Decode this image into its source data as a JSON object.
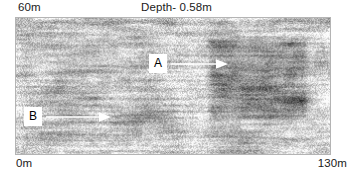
{
  "figure": {
    "type": "gpr-depth-slice",
    "top_left_label": "60m",
    "depth_label": "Depth- 0.58m",
    "bottom_left_label": "0m",
    "bottom_right_label": "130m"
  },
  "annotations": [
    {
      "id": "A",
      "label": "A",
      "arrow_direction": "right",
      "arrow_color": "#ffffff",
      "box_background": "#ffffff",
      "box_text_color": "#000000"
    },
    {
      "id": "B",
      "label": "B",
      "arrow_direction": "right",
      "arrow_color": "#ffffff",
      "box_background": "#ffffff",
      "box_text_color": "#000000"
    }
  ],
  "chart_data": {
    "type": "heatmap",
    "title": "Depth- 0.58m",
    "xlabel": "",
    "ylabel": "",
    "x_axis": {
      "start_label": "0m",
      "end_label": "130m",
      "start_value": 0,
      "end_value": 130,
      "units": "m"
    },
    "y_axis": {
      "top_label": "60m",
      "bottom_label": "0m",
      "top_value": 60,
      "bottom_value": 0,
      "units": "m"
    },
    "depth": 0.58,
    "depth_units": "m",
    "colormap": "grayscale",
    "grid": false,
    "legend": "none",
    "background_color": "#c8c8c8",
    "features": [
      {
        "name": "dark-anomaly-block",
        "marker": "A",
        "description": "large dark high-amplitude rectangular anomaly right of centre",
        "x_range_m": [
          78,
          122
        ],
        "y_range_m": [
          14,
          52
        ],
        "relative_intensity": 0.72
      },
      {
        "name": "horizontal-banding",
        "marker": "B",
        "description": "strong horizontal layered banding across lower left half",
        "x_range_m": [
          0,
          70
        ],
        "y_range_m": [
          4,
          22
        ],
        "relative_intensity": 0.58
      }
    ]
  }
}
